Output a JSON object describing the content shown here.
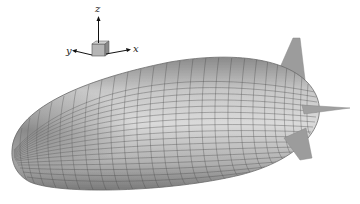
{
  "figure": {
    "colors": {
      "hull": "#a9a9a9",
      "hull_light": "#d4d4d4",
      "hull_dark": "#6e6e6e",
      "mesh_line": "#4a4a4a",
      "fin": "#9a9a9a",
      "background": "#ffffff"
    }
  },
  "axes_triad": {
    "labels": {
      "x": "x",
      "y": "y",
      "z": "z"
    }
  }
}
